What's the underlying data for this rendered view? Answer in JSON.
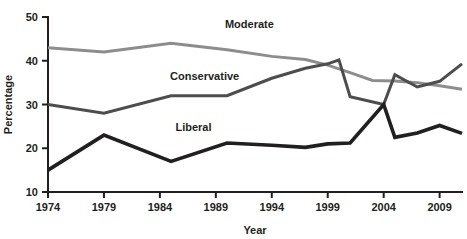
{
  "chart_data": {
    "type": "line",
    "title": "",
    "xlabel": "Year",
    "ylabel": "Percentage",
    "xlim": [
      1974,
      2011
    ],
    "ylim": [
      10,
      50
    ],
    "grid": false,
    "legend_position": "inline-labels",
    "x_ticks": [
      "1974",
      "1979",
      "1984",
      "1989",
      "1994",
      "1999",
      "2004",
      "2009"
    ],
    "x_tick_values": [
      1974,
      1979,
      1984,
      1989,
      1994,
      1999,
      2004,
      2009
    ],
    "y_ticks": [
      "10",
      "20",
      "30",
      "40",
      "50"
    ],
    "y_tick_values": [
      10,
      20,
      30,
      40,
      50
    ],
    "series": [
      {
        "name": "Moderate",
        "color": "#8d8d8d",
        "width": 3,
        "label_x": 1992,
        "label_y": 47.5,
        "x": [
          1974,
          1979,
          1985,
          1990,
          1994,
          1997,
          1999,
          2001,
          2003,
          2005,
          2007,
          2009,
          2011
        ],
        "values": [
          43,
          42,
          44,
          42.5,
          41,
          40.3,
          39,
          37.3,
          35.5,
          35.4,
          35,
          34.3,
          33.5
        ]
      },
      {
        "name": "Conservative",
        "color": "#4d4d4d",
        "width": 3,
        "label_x": 1988,
        "label_y": 35.5,
        "x": [
          1974,
          1979,
          1985,
          1990,
          1994,
          1997,
          1999,
          2000,
          2001,
          2004,
          2005,
          2007,
          2009,
          2011
        ],
        "values": [
          30,
          28,
          32,
          32,
          36,
          38.3,
          39.3,
          40.2,
          31.8,
          30,
          36.8,
          34,
          35.3,
          39.3
        ]
      },
      {
        "name": "Liberal",
        "color": "#231f20",
        "width": 3.6,
        "label_x": 1987,
        "label_y": 24,
        "x": [
          1974,
          1979,
          1985,
          1990,
          1994,
          1997,
          1999,
          2001,
          2004,
          2005,
          2007,
          2009,
          2011
        ],
        "values": [
          15,
          23,
          17,
          21.2,
          20.7,
          20.2,
          21,
          21.2,
          30,
          22.5,
          23.5,
          25.2,
          23.4
        ]
      }
    ]
  }
}
